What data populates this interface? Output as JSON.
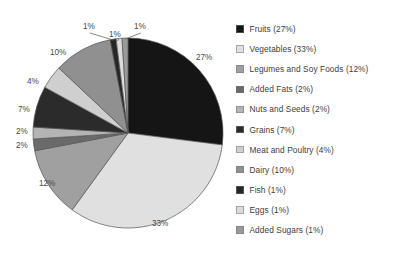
{
  "title_partial": "",
  "legend": {
    "position": "right",
    "items": [
      {
        "label": "Fruits (27%)",
        "color": "#151515"
      },
      {
        "label": "Vegetables (33%)",
        "color": "#e0e0e0"
      },
      {
        "label": "Legumes and Soy Foods (12%)",
        "color": "#a0a0a0"
      },
      {
        "label": "Added Fats (2%)",
        "color": "#6a6a6a"
      },
      {
        "label": "Nuts and Seeds (2%)",
        "color": "#b4b4b4"
      },
      {
        "label": "Grains (7%)",
        "color": "#2b2b2b"
      },
      {
        "label": "Meat and Poultry (4%)",
        "color": "#cfcfcf"
      },
      {
        "label": "Dairy (10%)",
        "color": "#909090"
      },
      {
        "label": "Fish (1%)",
        "color": "#262626"
      },
      {
        "label": "Eggs (1%)",
        "color": "#dcdcdc"
      },
      {
        "label": "Added Sugars (1%)",
        "color": "#9a9a9a"
      }
    ]
  },
  "chart_data": {
    "type": "pie",
    "title": "",
    "xlabel": "",
    "ylabel": "",
    "direction": "counterclockwise",
    "start_angle_deg": 90,
    "total": 100,
    "categories": [
      "Fruits",
      "Vegetables",
      "Legumes and Soy Foods",
      "Added Fats",
      "Nuts and Seeds",
      "Grains",
      "Meat and Poultry",
      "Dairy",
      "Fish",
      "Eggs",
      "Added Sugars"
    ],
    "values": [
      27,
      33,
      12,
      2,
      2,
      7,
      4,
      10,
      1,
      1,
      1
    ],
    "data_labels": [
      "27%",
      "33%",
      "12%",
      "2%",
      "2%",
      "7%",
      "4%",
      "10%",
      "1%",
      "1%",
      "1%"
    ],
    "colors": [
      "#151515",
      "#e0e0e0",
      "#a0a0a0",
      "#6a6a6a",
      "#b4b4b4",
      "#2b2b2b",
      "#cfcfcf",
      "#909090",
      "#262626",
      "#dcdcdc",
      "#9a9a9a"
    ],
    "legend_entries": [
      "Fruits (27%)",
      "Vegetables (33%)",
      "Legumes and Soy Foods (12%)",
      "Added Fats (2%)",
      "Nuts and Seeds (2%)",
      "Grains (7%)",
      "Meat and Poultry (4%)",
      "Dairy (10%)",
      "Fish (1%)",
      "Eggs (1%)",
      "Added Sugars (1%)"
    ],
    "grid": false,
    "geometry": {
      "center_x": 128,
      "center_y": 133,
      "radius": 95
    },
    "labels_outside": [
      {
        "text": "27%",
        "x": 196,
        "y": 60,
        "leader": false
      },
      {
        "text": "33%",
        "x": 152,
        "y": 226,
        "leader": false
      },
      {
        "text": "12%",
        "x": 39,
        "y": 186,
        "leader": false
      },
      {
        "text": "2%",
        "x": 16,
        "y": 148,
        "leader": false
      },
      {
        "text": "2%",
        "x": 16,
        "y": 134,
        "leader": false
      },
      {
        "text": "7%",
        "x": 18,
        "y": 112,
        "leader": false
      },
      {
        "text": "4%",
        "x": 27,
        "y": 84,
        "leader": false
      },
      {
        "text": "10%",
        "x": 50,
        "y": 55,
        "leader": false
      },
      {
        "text": "1%",
        "x": 83,
        "y": 29,
        "leader": true
      },
      {
        "text": "1%",
        "x": 109,
        "y": 37,
        "leader": true
      },
      {
        "text": "1%",
        "x": 134,
        "y": 29,
        "leader": true
      }
    ]
  }
}
